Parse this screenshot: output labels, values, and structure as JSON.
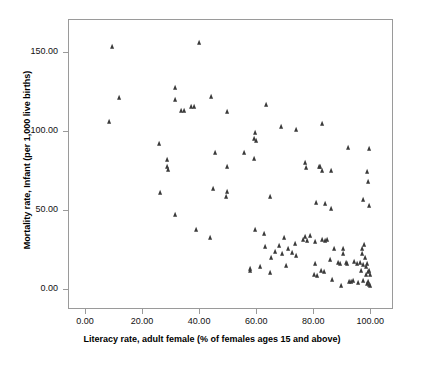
{
  "chart_data": {
    "type": "scatter",
    "title": "",
    "xlabel": "Literacy rate, adult female (% of females ages 15 and above)",
    "ylabel": "Mortality rate, Infant (per 1,000 live births)",
    "xlim": [
      -6,
      108
    ],
    "ylim": [
      -13,
      171
    ],
    "grid": false,
    "legend": null,
    "marker": "triangle",
    "marker_color": "#3a3a3a",
    "xticks": [
      0,
      20,
      40,
      60,
      80,
      100
    ],
    "xtick_labels": [
      "0.00",
      "20.00",
      "40.00",
      "60.00",
      "80.00",
      "100.00"
    ],
    "yticks": [
      0,
      50,
      100,
      150
    ],
    "ytick_labels": [
      "0.00",
      "50.00",
      "100.00",
      "150.00"
    ],
    "series": [
      {
        "name": "Countries",
        "points": [
          [
            9.3,
            154.0
          ],
          [
            12.0,
            121.5
          ],
          [
            8.4,
            106.5
          ],
          [
            39.8,
            156.5
          ],
          [
            31.6,
            128.0
          ],
          [
            31.4,
            120.0
          ],
          [
            33.6,
            113.5
          ],
          [
            34.6,
            113.0
          ],
          [
            37.0,
            115.5
          ],
          [
            38.3,
            115.5
          ],
          [
            44.2,
            122.0
          ],
          [
            49.7,
            112.5
          ],
          [
            63.4,
            117.0
          ],
          [
            26.0,
            92.5
          ],
          [
            28.6,
            82.0
          ],
          [
            28.8,
            77.5
          ],
          [
            29.1,
            76.0
          ],
          [
            45.4,
            86.5
          ],
          [
            49.6,
            78.0
          ],
          [
            55.9,
            86.5
          ],
          [
            59.4,
            82.5
          ],
          [
            59.7,
            99.0
          ],
          [
            59.4,
            95.5
          ],
          [
            60.0,
            94.0
          ],
          [
            68.8,
            103.0
          ],
          [
            74.0,
            101.0
          ],
          [
            83.2,
            105.0
          ],
          [
            77.0,
            80.0
          ],
          [
            77.4,
            77.0
          ],
          [
            82.1,
            78.0
          ],
          [
            82.4,
            77.5
          ],
          [
            83.0,
            75.5
          ],
          [
            86.2,
            75.0
          ],
          [
            92.2,
            90.0
          ],
          [
            99.6,
            89.0
          ],
          [
            99.0,
            74.5
          ],
          [
            99.1,
            68.0
          ],
          [
            26.2,
            61.0
          ],
          [
            45.0,
            63.5
          ],
          [
            49.6,
            62.0
          ],
          [
            49.4,
            58.5
          ],
          [
            64.9,
            58.5
          ],
          [
            80.9,
            55.0
          ],
          [
            84.1,
            54.0
          ],
          [
            86.2,
            51.0
          ],
          [
            97.6,
            57.0
          ],
          [
            99.5,
            53.0
          ],
          [
            31.5,
            47.5
          ],
          [
            38.8,
            38.0
          ],
          [
            43.9,
            32.5
          ],
          [
            59.6,
            38.0
          ],
          [
            62.9,
            35.5
          ],
          [
            69.6,
            33.0
          ],
          [
            76.4,
            31.5
          ],
          [
            77.2,
            33.5
          ],
          [
            78.0,
            31.0
          ],
          [
            79.0,
            34.0
          ],
          [
            80.7,
            30.0
          ],
          [
            83.2,
            31.5
          ],
          [
            84.2,
            31.0
          ],
          [
            84.8,
            31.5
          ],
          [
            65.2,
            20.0
          ],
          [
            65.0,
            10.5
          ],
          [
            69.0,
            22.5
          ],
          [
            70.3,
            15.0
          ],
          [
            74.1,
            21.5
          ],
          [
            80.5,
            16.0
          ],
          [
            80.2,
            9.0
          ],
          [
            81.3,
            8.5
          ],
          [
            82.6,
            11.5
          ],
          [
            83.7,
            11.0
          ],
          [
            86.0,
            19.0
          ],
          [
            86.6,
            6.0
          ],
          [
            87.2,
            25.5
          ],
          [
            88.6,
            17.0
          ],
          [
            89.4,
            16.5
          ],
          [
            89.8,
            2.5
          ],
          [
            90.4,
            26.0
          ],
          [
            90.3,
            22.5
          ],
          [
            91.5,
            17.0
          ],
          [
            91.8,
            16.0
          ],
          [
            92.5,
            5.0
          ],
          [
            93.4,
            4.5
          ],
          [
            94.0,
            5.5
          ],
          [
            94.4,
            17.5
          ],
          [
            95.2,
            16.0
          ],
          [
            95.6,
            4.0
          ],
          [
            96.3,
            17.0
          ],
          [
            96.8,
            12.0
          ],
          [
            97.0,
            26.0
          ],
          [
            97.2,
            22.5
          ],
          [
            97.4,
            15.5
          ],
          [
            97.6,
            5.5
          ],
          [
            98.0,
            28.0
          ],
          [
            98.2,
            20.0
          ],
          [
            98.4,
            14.0
          ],
          [
            98.5,
            9.0
          ],
          [
            98.8,
            3.5
          ],
          [
            99.0,
            16.5
          ],
          [
            99.2,
            11.0
          ],
          [
            99.3,
            5.0
          ],
          [
            99.5,
            12.0
          ],
          [
            99.6,
            3.0
          ],
          [
            99.8,
            9.5
          ],
          [
            99.9,
            2.5
          ],
          [
            58.0,
            11.5
          ],
          [
            57.8,
            13.0
          ],
          [
            61.5,
            14.0
          ],
          [
            63.0,
            27.0
          ],
          [
            66.5,
            24.0
          ],
          [
            68.0,
            27.5
          ],
          [
            71.0,
            25.5
          ],
          [
            72.5,
            23.0
          ],
          [
            73.5,
            29.0
          ]
        ]
      }
    ]
  }
}
